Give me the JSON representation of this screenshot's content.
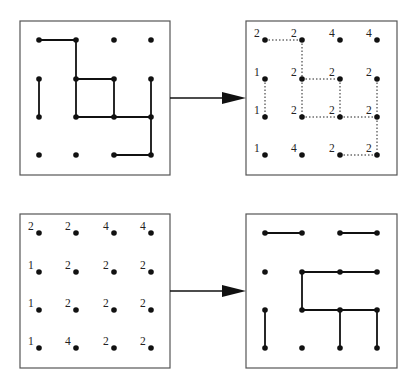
{
  "grid": {
    "cols": 4,
    "rows": 4,
    "x_offsets": [
      19,
      56,
      94,
      131
    ],
    "y_offsets": [
      19,
      58,
      96,
      134
    ]
  },
  "labels": [
    [
      "2",
      "2",
      "4",
      "4"
    ],
    [
      "1",
      "2",
      "2",
      "2"
    ],
    [
      "1",
      "2",
      "2",
      "2"
    ],
    [
      "1",
      "4",
      "2",
      "2"
    ]
  ],
  "panels": [
    {
      "id": "top-left",
      "frame": {
        "x": 20,
        "y": 21,
        "w": 150,
        "h": 154
      },
      "show_labels": false,
      "edge_style": "solid",
      "edges": [
        [
          [
            0,
            0
          ],
          [
            1,
            0
          ]
        ],
        [
          [
            1,
            0
          ],
          [
            1,
            1
          ]
        ],
        [
          [
            1,
            1
          ],
          [
            2,
            1
          ]
        ],
        [
          [
            1,
            1
          ],
          [
            1,
            2
          ]
        ],
        [
          [
            2,
            1
          ],
          [
            2,
            2
          ]
        ],
        [
          [
            0,
            1
          ],
          [
            0,
            2
          ]
        ],
        [
          [
            1,
            2
          ],
          [
            2,
            2
          ]
        ],
        [
          [
            2,
            2
          ],
          [
            3,
            2
          ]
        ],
        [
          [
            3,
            1
          ],
          [
            3,
            2
          ]
        ],
        [
          [
            3,
            2
          ],
          [
            3,
            3
          ]
        ],
        [
          [
            2,
            3
          ],
          [
            3,
            3
          ]
        ]
      ]
    },
    {
      "id": "top-right",
      "frame": {
        "x": 246,
        "y": 21,
        "w": 151,
        "h": 154
      },
      "show_labels": true,
      "edge_style": "dotted",
      "edges": [
        [
          [
            0,
            0
          ],
          [
            1,
            0
          ]
        ],
        [
          [
            1,
            0
          ],
          [
            1,
            1
          ]
        ],
        [
          [
            1,
            1
          ],
          [
            2,
            1
          ]
        ],
        [
          [
            1,
            1
          ],
          [
            1,
            2
          ]
        ],
        [
          [
            2,
            1
          ],
          [
            2,
            2
          ]
        ],
        [
          [
            0,
            1
          ],
          [
            0,
            2
          ]
        ],
        [
          [
            1,
            2
          ],
          [
            2,
            2
          ]
        ],
        [
          [
            2,
            2
          ],
          [
            3,
            2
          ]
        ],
        [
          [
            3,
            1
          ],
          [
            3,
            2
          ]
        ],
        [
          [
            3,
            2
          ],
          [
            3,
            3
          ]
        ],
        [
          [
            2,
            3
          ],
          [
            3,
            3
          ]
        ]
      ]
    },
    {
      "id": "bottom-left",
      "frame": {
        "x": 20,
        "y": 214,
        "w": 150,
        "h": 154
      },
      "show_labels": true,
      "edge_style": "none",
      "edges": []
    },
    {
      "id": "bottom-right",
      "frame": {
        "x": 246,
        "y": 214,
        "w": 151,
        "h": 154
      },
      "show_labels": false,
      "edge_style": "solid",
      "edges": [
        [
          [
            0,
            0
          ],
          [
            1,
            0
          ]
        ],
        [
          [
            2,
            0
          ],
          [
            3,
            0
          ]
        ],
        [
          [
            1,
            1
          ],
          [
            2,
            1
          ]
        ],
        [
          [
            2,
            1
          ],
          [
            3,
            1
          ]
        ],
        [
          [
            1,
            1
          ],
          [
            1,
            2
          ]
        ],
        [
          [
            1,
            2
          ],
          [
            2,
            2
          ]
        ],
        [
          [
            2,
            2
          ],
          [
            3,
            2
          ]
        ],
        [
          [
            0,
            2
          ],
          [
            0,
            3
          ]
        ],
        [
          [
            2,
            2
          ],
          [
            2,
            3
          ]
        ],
        [
          [
            3,
            2
          ],
          [
            3,
            3
          ]
        ]
      ]
    }
  ],
  "arrows": [
    {
      "id": "top-arrow",
      "x1": 170,
      "x2": 246,
      "y": 98
    },
    {
      "id": "bottom-arrow",
      "x1": 170,
      "x2": 246,
      "y": 291
    }
  ]
}
